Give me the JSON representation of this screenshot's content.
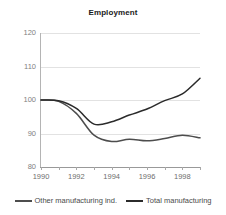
{
  "chart_data": {
    "type": "line",
    "title": "Employment",
    "xlabel": "",
    "ylabel": "",
    "x": [
      1990,
      1991,
      1992,
      1993,
      1994,
      1995,
      1996,
      1997,
      1998,
      1999
    ],
    "xlim": [
      1990,
      1999
    ],
    "ylim": [
      80,
      120
    ],
    "yticks": [
      120,
      110,
      100,
      90,
      80
    ],
    "ytick_labels": [
      "120",
      "110",
      "100",
      "90",
      "80"
    ],
    "xticks": [
      1990,
      1991,
      1992,
      1993,
      1994,
      1995,
      1996,
      1997,
      1998,
      1999
    ],
    "xtick_labels_shown": [
      "1990",
      "1992",
      "1994",
      "1996",
      "1998"
    ],
    "xtick_labeled_values": [
      1990,
      1992,
      1994,
      1996,
      1998
    ],
    "grid": "horizontal",
    "legend_position": "bottom",
    "series": [
      {
        "name": "Other manufacturing ind.",
        "color": "#4d4d4d",
        "values": [
          100.0,
          99.6,
          96.0,
          89.5,
          87.6,
          88.3,
          87.8,
          88.5,
          89.5,
          88.7
        ]
      },
      {
        "name": "Total manufacturing",
        "color": "#2b2b2b",
        "values": [
          100.0,
          99.8,
          97.5,
          92.8,
          93.5,
          95.5,
          97.3,
          99.8,
          101.8,
          106.5
        ]
      }
    ]
  },
  "legend": {
    "entries": [
      {
        "label": "Other manufacturing ind."
      },
      {
        "label": "Total manufacturing"
      }
    ]
  },
  "colors": {
    "grid": "#e2e2e2",
    "axis": "#999999",
    "tick_text": "#767676",
    "title_text": "#1a1a1a",
    "background": "#ffffff"
  }
}
